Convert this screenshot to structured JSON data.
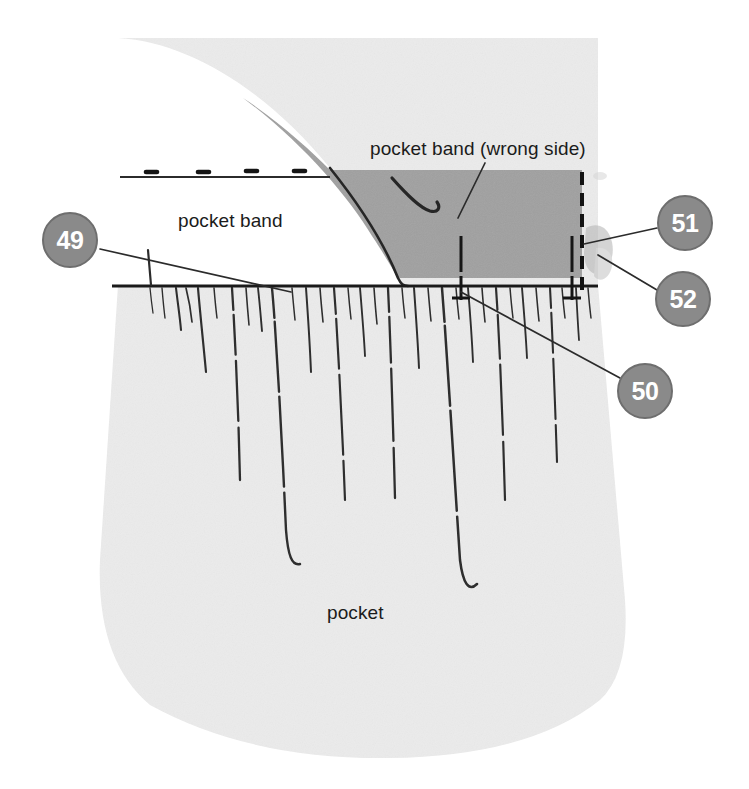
{
  "figure": {
    "colors": {
      "pocket_fabric": "#ebebeb",
      "band_wrong_side": "#a0a0a0",
      "callout_fill": "#8a8a8a",
      "callout_border": "#6e6e6e",
      "callout_text": "#ffffff",
      "ink": "#1b1b1b",
      "background": "#ffffff"
    },
    "labels": [
      {
        "id": "pocket-band-wrong-side",
        "text": "pocket band (wrong side)",
        "x": 370,
        "y": 139
      },
      {
        "id": "pocket-band",
        "text": "pocket band",
        "x": 178,
        "y": 211
      },
      {
        "id": "pocket",
        "text": "pocket",
        "x": 327,
        "y": 603
      }
    ],
    "callouts": [
      {
        "id": "callout-49",
        "number": "49",
        "cx": 70,
        "cy": 240
      },
      {
        "id": "callout-51",
        "number": "51",
        "cx": 685,
        "cy": 223
      },
      {
        "id": "callout-52",
        "number": "52",
        "cx": 683,
        "cy": 299
      },
      {
        "id": "callout-50",
        "number": "50",
        "cx": 645,
        "cy": 391
      }
    ]
  }
}
